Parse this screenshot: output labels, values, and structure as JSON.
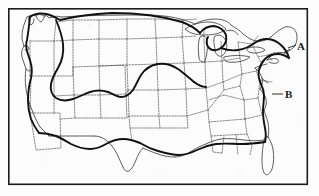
{
  "figure": {
    "background_color": "#fdfdfd",
    "frame_color": "#1c1c1c",
    "line_color": "#2a2a2a",
    "range_line_color": "#111111",
    "state_border_style": "dotted"
  },
  "labels": [
    {
      "id": "label-a",
      "text": "A",
      "x": 299,
      "y": 51,
      "leader_from_x": 289,
      "leader_from_y": 47,
      "region": "New England coast"
    },
    {
      "id": "label-b",
      "text": "B",
      "x": 288,
      "y": 97,
      "leader_from_x": 275,
      "leader_from_y": 95,
      "region": "Mid-Atlantic coast"
    }
  ],
  "frame": {
    "x": 8,
    "y": 8,
    "width": 300,
    "height": 177
  },
  "map_features": {
    "coastline_name": "us-coastline",
    "great_lakes_name": "great-lakes",
    "state_borders_name": "state-boundaries",
    "range_boundary_name": "distribution-boundary-line"
  }
}
